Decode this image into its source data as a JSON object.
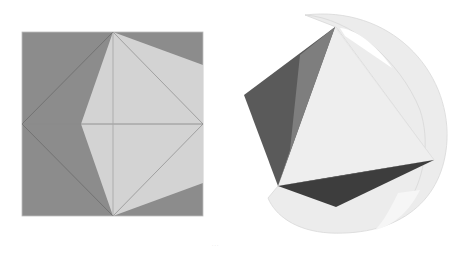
{
  "figure": {
    "left_panel": {
      "label": "octahedron-projection-in-square",
      "colors": {
        "background": "#8c8c8c",
        "face": "#d3d3d3",
        "edge": "#7a7a7a",
        "light_edge": "#9e9e9e"
      }
    },
    "right_panel": {
      "label": "octahedron-inscribed-in-sphere",
      "colors": {
        "sphere": "#ececec",
        "sphere_edge": "#d6d6d6",
        "front_face": "#eeeeee",
        "dark_face": "#4a4a4a",
        "mid_face": "#7a7a7a",
        "bottom_face": "#3f3f3f"
      }
    },
    "caption": "· · ·"
  }
}
